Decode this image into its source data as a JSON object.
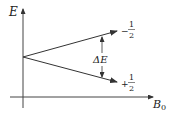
{
  "diagram": {
    "y_axis": {
      "label": "E"
    },
    "x_axis": {
      "label_main": "B",
      "label_sub": "0"
    },
    "upper_level": {
      "sign": "−",
      "numerator": "1",
      "denominator": "2"
    },
    "lower_level": {
      "sign": "+",
      "numerator": "1",
      "denominator": "2"
    },
    "gap": {
      "label": "ΔE"
    },
    "colors": {
      "line": "#333333",
      "background": "#ffffff"
    }
  }
}
